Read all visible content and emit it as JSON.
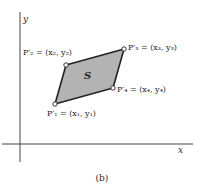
{
  "diagram": {
    "caption": "(b)",
    "axes": {
      "x_label": "x",
      "y_label": "y"
    },
    "region_label": "S",
    "region_fill": "#b3b3b3",
    "stroke_color": "#222222",
    "vertices": [
      {
        "id": "P1",
        "name": "P'1",
        "label": "P′₁ = (x₁, y₁)",
        "px": [
          55,
          104
        ]
      },
      {
        "id": "P2",
        "name": "P'2",
        "label": "P′₂ = (x₂, y₂)",
        "px": [
          66,
          65
        ]
      },
      {
        "id": "P3",
        "name": "P'3",
        "label": "P′₃ = (x₃, y₃)",
        "px": [
          124,
          49
        ]
      },
      {
        "id": "P4",
        "name": "P'4",
        "label": "P′₄ = (x₄, y₄)",
        "px": [
          113,
          88
        ]
      }
    ]
  }
}
